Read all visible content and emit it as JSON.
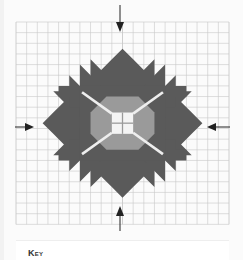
{
  "diagram": {
    "type": "cross-stitch pattern chart",
    "grid": {
      "columns": 20,
      "rows": 19,
      "line_color": "#c8c8c8",
      "background": "#ffffff"
    },
    "colors": {
      "dark": "#5a5a5a",
      "medium": "#9a9a9a",
      "light": "#f4f4f4",
      "stitch_line": "#eeeeee",
      "arrow": "#222222"
    },
    "center_arrows": [
      "top",
      "bottom",
      "left",
      "right"
    ]
  },
  "key": {
    "title": "Key"
  }
}
